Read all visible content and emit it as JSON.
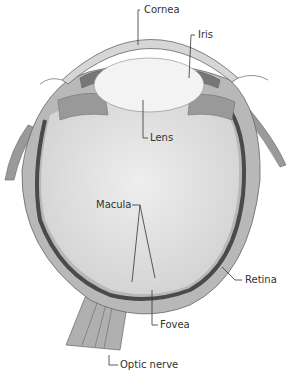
{
  "diagram": {
    "labels": {
      "cornea": "Cornea",
      "iris": "Iris",
      "lens": "Lens",
      "macula": "Macula",
      "retina": "Retina",
      "fovea": "Fovea",
      "optic_nerve": "Optic nerve"
    },
    "colors": {
      "sclera": "#b5b5b5",
      "vitreous": "#dcdcdc",
      "lens": "#f2f2f2",
      "retina": "#555555",
      "outline": "#666666",
      "leader": "#333333"
    }
  }
}
